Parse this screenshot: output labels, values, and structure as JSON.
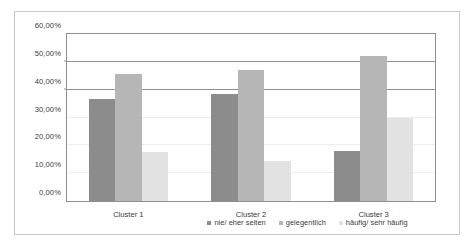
{
  "chart_data": {
    "type": "bar",
    "title": "",
    "subtitle": "",
    "xlabel": "",
    "ylabel": "",
    "categories": [
      "Cluster 1",
      "Cluster 2",
      "Cluster 3"
    ],
    "series": [
      {
        "name": "nie/ eher selten",
        "color": "#8c8c8c",
        "values": [
          36.8,
          38.6,
          17.9
        ]
      },
      {
        "name": "gelegentlich",
        "color": "#b6b6b6",
        "values": [
          45.5,
          47.2,
          52.0
        ]
      },
      {
        "name": "häufig/ sehr häufig",
        "color": "#e2e2e2",
        "values": [
          17.7,
          14.2,
          29.8
        ]
      }
    ],
    "ylim": [
      0,
      60
    ],
    "ytick_values": [
      0,
      10,
      20,
      30,
      40,
      50,
      60
    ],
    "ytick_labels": [
      "0,00%",
      "10,00%",
      "20,00%",
      "30,00%",
      "40,00%",
      "50,00%",
      "60,00%"
    ],
    "grid": true,
    "grid_major_values": [
      40,
      50,
      60
    ],
    "grid_minor_values": [
      10,
      20,
      30
    ],
    "legend_position": "bottom",
    "legend_entries": [
      "nie/ eher selten",
      "gelegentlich",
      "häufig/ sehr häufig"
    ],
    "annotations": [],
    "axis_color": "#8f8f8f",
    "grid_color": "#8f8f8f",
    "grid_minor_color": "#ededed",
    "text_color": "#3a3a3a",
    "background": "#ffffff",
    "frame_color": "#c8c8c8"
  }
}
